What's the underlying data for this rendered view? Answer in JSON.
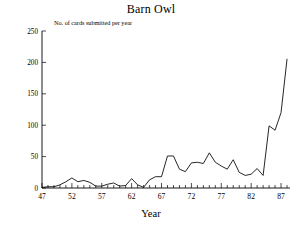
{
  "chart_data": {
    "type": "line",
    "title": "Barn Owl",
    "xlabel": "Year",
    "ylabel": "No. of cards submitted per year",
    "xlim": [
      47,
      88.5
    ],
    "ylim": [
      0,
      250
    ],
    "grid": false,
    "legend": null,
    "xticks": [
      47,
      52,
      57,
      62,
      67,
      72,
      77,
      82,
      87
    ],
    "xtick_labels": [
      "47",
      "52",
      "57",
      "62",
      "67",
      "72",
      "77",
      "82",
      "87"
    ],
    "yticks": [
      0,
      50,
      100,
      150,
      200,
      250
    ],
    "ytick_labels": [
      "0",
      "50",
      "100",
      "150",
      "200",
      "250"
    ],
    "minor_xtick_interval": 1,
    "x": [
      47,
      48,
      49,
      50,
      51,
      52,
      53,
      54,
      55,
      56,
      57,
      58,
      59,
      60,
      61,
      62,
      63,
      64,
      65,
      66,
      67,
      68,
      69,
      70,
      71,
      72,
      73,
      74,
      75,
      76,
      77,
      78,
      79,
      80,
      81,
      82,
      83,
      84,
      85,
      86,
      87,
      88
    ],
    "values": [
      1,
      2,
      2,
      5,
      10,
      16,
      10,
      12,
      9,
      3,
      3,
      6,
      8,
      3,
      4,
      15,
      5,
      1,
      13,
      18,
      18,
      51,
      51,
      30,
      26,
      40,
      41,
      39,
      56,
      41,
      35,
      30,
      45,
      25,
      20,
      22,
      31,
      20,
      99,
      92,
      120,
      205
    ],
    "series_name": "Barn Owl cards submitted"
  },
  "title": "Barn Owl",
  "axes": {
    "y_label": "No. of cards submitted per year",
    "x_label": "Year"
  }
}
